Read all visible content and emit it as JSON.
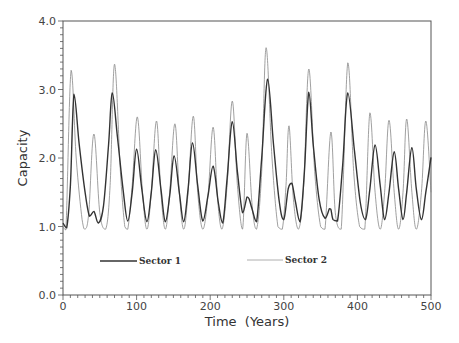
{
  "chart_data": {
    "type": "line",
    "title": "",
    "xlabel": "Time  (Years)",
    "ylabel": "Capacity",
    "xlim": [
      0,
      500
    ],
    "ylim": [
      0.0,
      4.0
    ],
    "xticks": [
      0,
      100,
      200,
      300,
      400,
      500
    ],
    "xtick_labels": [
      "0",
      "100",
      "200",
      "300",
      "400",
      "500"
    ],
    "yticks": [
      0.0,
      1.0,
      2.0,
      3.0,
      4.0
    ],
    "ytick_labels": [
      "0.0",
      "1.0",
      "2.0",
      "3.0",
      "4.0"
    ],
    "grid": false,
    "legend_position": "inside-lower",
    "series": [
      {
        "name": "Sector 1",
        "style": "thick-dark",
        "color": "#333333",
        "x": [
          0,
          5,
          10,
          15,
          22,
          30,
          36,
          42,
          48,
          55,
          62,
          67,
          74,
          82,
          88,
          94,
          100,
          107,
          114,
          120,
          126,
          133,
          139,
          145,
          151,
          158,
          164,
          170,
          176,
          183,
          190,
          197,
          204,
          211,
          217,
          223,
          230,
          237,
          244,
          250,
          253,
          257,
          263,
          270,
          278,
          286,
          294,
          300,
          306,
          311,
          316,
          322,
          328,
          334,
          340,
          348,
          356,
          362,
          364,
          367,
          373,
          380,
          387,
          396,
          404,
          411,
          417,
          424,
          431,
          437,
          443,
          450,
          456,
          462,
          467,
          474,
          480,
          487,
          493,
          500
        ],
        "y": [
          1.05,
          0.98,
          1.6,
          2.93,
          2.2,
          1.5,
          1.15,
          1.22,
          1.05,
          1.3,
          2.2,
          2.95,
          2.3,
          1.5,
          1.08,
          1.5,
          2.13,
          1.55,
          1.07,
          1.5,
          2.12,
          1.55,
          1.07,
          1.45,
          2.03,
          1.5,
          1.07,
          1.55,
          2.22,
          1.6,
          1.08,
          1.45,
          1.88,
          1.35,
          1.05,
          1.7,
          2.53,
          1.8,
          1.2,
          1.43,
          1.4,
          1.25,
          1.07,
          2.0,
          3.15,
          2.2,
          1.35,
          1.1,
          1.55,
          1.63,
          1.35,
          1.07,
          1.8,
          2.96,
          2.2,
          1.4,
          1.12,
          1.26,
          1.25,
          1.1,
          1.08,
          1.9,
          2.95,
          2.1,
          1.35,
          1.1,
          1.55,
          2.19,
          1.6,
          1.1,
          1.5,
          2.09,
          1.55,
          1.1,
          1.5,
          2.15,
          1.55,
          1.1,
          1.5,
          2.01
        ]
      },
      {
        "name": "Sector 2",
        "style": "thin-light",
        "color": "#888888",
        "x": [
          0,
          4,
          11,
          18,
          26,
          30,
          35,
          42,
          50,
          58,
          64,
          70,
          78,
          84,
          88,
          94,
          101,
          108,
          114,
          120,
          127,
          133,
          139,
          145,
          152,
          158,
          164,
          170,
          177,
          183,
          190,
          197,
          204,
          210,
          216,
          223,
          230,
          237,
          244,
          250,
          257,
          263,
          270,
          276,
          284,
          292,
          298,
          303,
          307,
          313,
          320,
          327,
          334,
          342,
          350,
          356,
          364,
          370,
          378,
          387,
          395,
          403,
          410,
          417,
          424,
          431,
          437,
          443,
          450,
          456,
          462,
          467,
          474,
          480,
          487,
          493,
          500
        ],
        "y": [
          1.0,
          0.95,
          3.28,
          2.0,
          1.1,
          0.96,
          1.2,
          2.35,
          1.2,
          0.96,
          1.6,
          3.37,
          1.8,
          1.0,
          0.96,
          1.6,
          2.6,
          1.5,
          0.96,
          1.5,
          2.54,
          1.5,
          0.96,
          1.5,
          2.5,
          1.5,
          0.96,
          1.5,
          2.61,
          1.5,
          0.96,
          1.45,
          2.45,
          1.4,
          0.96,
          1.6,
          2.83,
          1.6,
          0.96,
          2.36,
          1.3,
          0.96,
          1.8,
          3.61,
          2.0,
          1.0,
          0.96,
          1.6,
          2.47,
          1.4,
          0.96,
          1.6,
          3.3,
          1.8,
          1.0,
          0.96,
          2.38,
          1.2,
          0.96,
          3.39,
          1.8,
          1.0,
          0.96,
          2.66,
          1.5,
          0.96,
          1.5,
          2.55,
          1.5,
          0.96,
          1.5,
          2.57,
          1.5,
          0.96,
          1.5,
          2.54,
          1.5
        ]
      }
    ],
    "legend": [
      {
        "label": "Sector 1",
        "style": "thick-dark"
      },
      {
        "label": "Sector 2",
        "style": "thin-light"
      }
    ]
  },
  "labels": {
    "xlabel": "Time  (Years)",
    "ylabel": "Capacity",
    "legend_1": "Sector 1",
    "legend_2": "Sector 2"
  }
}
